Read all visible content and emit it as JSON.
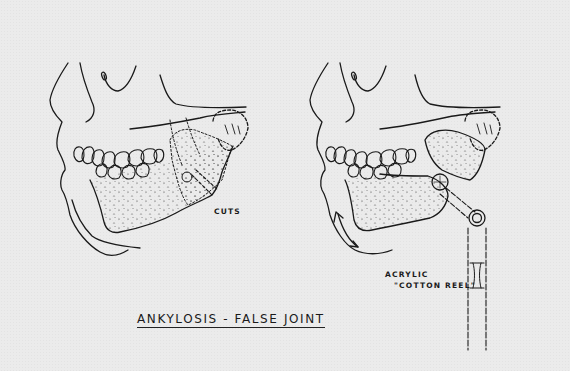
{
  "figure": {
    "title": "ANKYLOSIS - FALSE JOINT",
    "panels": [
      {
        "id": "left",
        "description": "Lateral view of skull and mandible showing ankylosed joint with osteotomy cuts",
        "labels": {
          "cuts": "CUTS"
        }
      },
      {
        "id": "right",
        "description": "Lateral view after creation of false joint with acrylic cotton reel interposition and arrow showing restored movement",
        "labels": {
          "acrylic_line1": "ACRYLIC",
          "acrylic_line2": "\"COTTON REEL\""
        }
      }
    ]
  },
  "colors": {
    "background": "#ebebeb",
    "ink": "#1a1a1a"
  }
}
